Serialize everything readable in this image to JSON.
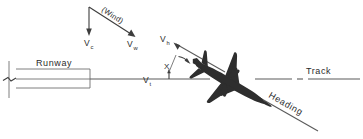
{
  "figure": {
    "background_color": "#ffffff",
    "line_color": "#5a5a5a",
    "text_color": "#2b2b2b",
    "aircraft_color": "#2e2e2e"
  },
  "wind_triangle": {
    "annotation": "(Wind)",
    "crosswind_vector": {
      "symbol": "V",
      "subscript": "c"
    },
    "wind_vector": {
      "symbol": "V",
      "subscript": "w"
    }
  },
  "runway": {
    "label": "Runway",
    "break_symbol": "break-mark"
  },
  "track": {
    "label": "Track",
    "velocity": {
      "symbol": "V",
      "subscript": "t"
    }
  },
  "heading": {
    "label": "Heading",
    "velocity": {
      "symbol": "V",
      "subscript": "h"
    }
  },
  "drift_angle": {
    "label": "X"
  },
  "aircraft": {
    "name": "aircraft-silhouette"
  }
}
